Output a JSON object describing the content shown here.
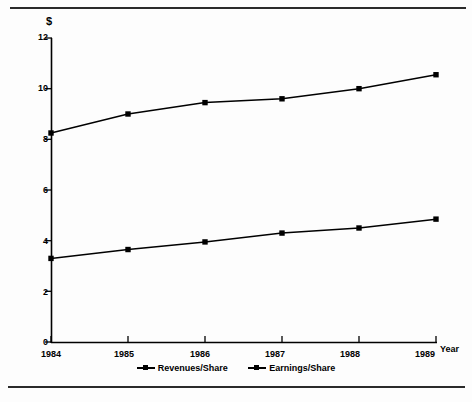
{
  "chart_data": {
    "type": "line",
    "title": "",
    "subtitle": "",
    "xlabel": "Year",
    "ylabel": "$",
    "categories": [
      "1984",
      "1985",
      "1986",
      "1987",
      "1988",
      "1989"
    ],
    "x": [
      1984,
      1985,
      1986,
      1987,
      1988,
      1989
    ],
    "series": [
      {
        "name": "Revenues/Share",
        "values": [
          8.25,
          9.0,
          9.45,
          9.6,
          10.0,
          10.55
        ],
        "marker": "square",
        "color": "#000000"
      },
      {
        "name": "Earnings/Share",
        "values": [
          3.3,
          3.65,
          3.95,
          4.3,
          4.5,
          4.85
        ],
        "marker": "square",
        "color": "#000000"
      }
    ],
    "ylim": [
      0,
      12
    ],
    "yticks": [
      0,
      2,
      4,
      6,
      8,
      10,
      12
    ],
    "ytick_labels": [
      "0",
      "2",
      "4",
      "6",
      "8",
      "10",
      "12"
    ],
    "xtick_labels": [
      "1984",
      "1985",
      "1986",
      "1987",
      "1988",
      "1989"
    ],
    "grid": false,
    "legend_position": "bottom-center"
  },
  "axes": {
    "y_axis_unit_label": "$",
    "x_axis_unit_label": "Year"
  },
  "legend": {
    "entries": [
      {
        "label": "Revenues/Share"
      },
      {
        "label": "Earnings/Share"
      }
    ]
  },
  "colors": {
    "ink": "#000000",
    "paper": "#fdfdfd",
    "rule": "#2a2a2a"
  }
}
